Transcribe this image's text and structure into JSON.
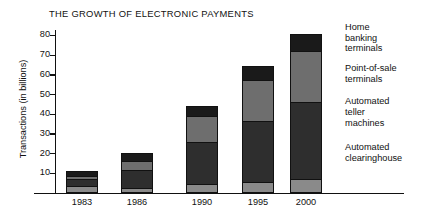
{
  "chart_data": {
    "type": "bar",
    "subtype": "stacked-vertical",
    "title": "THE GROWTH OF ELECTRONIC PAYMENTS",
    "xlabel": "",
    "ylabel": "Transactions (in billions)",
    "ylim": [
      0,
      83
    ],
    "yticks": [
      10,
      20,
      30,
      40,
      50,
      60,
      70,
      80
    ],
    "grid": false,
    "legend_position": "right",
    "categories": [
      "1983",
      "1986",
      "1990",
      "1995",
      "2000"
    ],
    "series": [
      {
        "name": "Automated clearinghouse",
        "color": "#8a8a8a",
        "values": [
          3.0,
          2.0,
          4.0,
          5.0,
          6.5
        ]
      },
      {
        "name": "Automated teller machines",
        "color": "#2e2e2e",
        "values": [
          4.0,
          9.5,
          21.5,
          31.5,
          39.5
        ]
      },
      {
        "name": "Point-of-sale terminals",
        "color": "#6e6e6e",
        "values": [
          1.5,
          5.0,
          14.0,
          21.0,
          26.0
        ]
      },
      {
        "name": "Home banking terminals",
        "color": "#1a1a1a",
        "values": [
          2.5,
          3.5,
          4.5,
          6.5,
          8.5
        ]
      }
    ],
    "totals": [
      11.0,
      20.0,
      44.0,
      64.0,
      80.5
    ]
  },
  "legend": {
    "items": [
      {
        "lines": [
          "Home",
          "banking",
          "terminals"
        ]
      },
      {
        "lines": [
          "Point-of-sale",
          "terminals"
        ]
      },
      {
        "lines": [
          "Automated",
          "teller",
          "machines"
        ]
      },
      {
        "lines": [
          "Automated",
          "clearinghouse"
        ]
      }
    ]
  },
  "layout": {
    "bar_centers_px": [
      82,
      137,
      202,
      258,
      306
    ],
    "baseline_px": 192.6,
    "px_per_unit": 1.9713
  }
}
